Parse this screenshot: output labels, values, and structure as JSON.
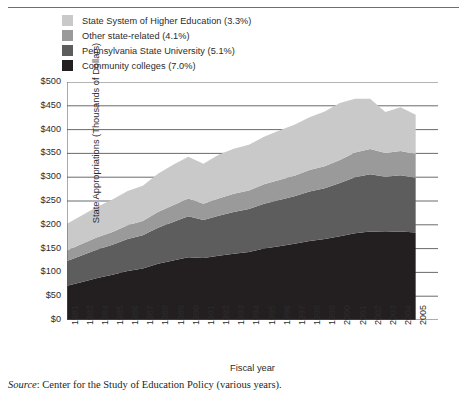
{
  "legend": {
    "items": [
      {
        "label": "State System of Higher Education (3.3%)",
        "color": "#c9c9c9",
        "name": "state-system-higher-education"
      },
      {
        "label": "Other state-related (4.1%)",
        "color": "#9a9a9a",
        "name": "other-state-related"
      },
      {
        "label": "Pennsylvania State University (5.1%)",
        "color": "#5d5d5d",
        "name": "pennsylvania-state-university"
      },
      {
        "label": "Community colleges (7.0%)",
        "color": "#231f20",
        "name": "community-colleges"
      }
    ]
  },
  "source": {
    "prefix": "Source",
    "text": ": Center for the Study of Education Policy (various years)."
  },
  "chart_data": {
    "type": "area",
    "stacked": true,
    "title": "",
    "xlabel": "Fiscal year",
    "ylabel": "State Appropriations (Thousands of Dollars)",
    "ylim": [
      0,
      500
    ],
    "ytick_step": 50,
    "ytick_labels": [
      "$500",
      "$450",
      "$400",
      "$350",
      "$300",
      "$250",
      "$200",
      "$150",
      "$100",
      "$50",
      "$0"
    ],
    "ytick_values": [
      500,
      450,
      400,
      350,
      300,
      250,
      200,
      150,
      100,
      50,
      0
    ],
    "grid": true,
    "legend_position": "above-left",
    "x": [
      1981,
      1982,
      1984,
      1985,
      1986,
      1987,
      1988,
      1989,
      1990,
      1991,
      1992,
      1993,
      1994,
      1995,
      1996,
      1997,
      1998,
      1999,
      2000,
      2001,
      2002,
      2003,
      2004,
      2005
    ],
    "categories": [
      "1981",
      "1982",
      "1984",
      "1985",
      "1986",
      "1987",
      "1988",
      "1989",
      "1990",
      "1991",
      "1992",
      "1993",
      "1994",
      "1995",
      "1996",
      "1997",
      "1998",
      "1999",
      "2000",
      "2001",
      "2002",
      "2003",
      "2004",
      "2005"
    ],
    "series": [
      {
        "name": "Community colleges (7.0%)",
        "color": "#231f20",
        "values": [
          72,
          80,
          88,
          95,
          103,
          108,
          118,
          125,
          132,
          130,
          135,
          139,
          143,
          150,
          155,
          160,
          166,
          170,
          176,
          182,
          186,
          185,
          186,
          184
        ]
      },
      {
        "name": "Pennsylvania State University (5.1%)",
        "color": "#5d5d5d",
        "values": [
          52,
          56,
          60,
          63,
          67,
          70,
          76,
          81,
          86,
          80,
          84,
          88,
          90,
          94,
          97,
          100,
          104,
          107,
          112,
          118,
          120,
          116,
          118,
          115
        ]
      },
      {
        "name": "Other state-related (4.1%)",
        "color": "#9a9a9a",
        "values": [
          22,
          24,
          26,
          27,
          29,
          30,
          33,
          35,
          37,
          34,
          36,
          38,
          39,
          41,
          42,
          43,
          45,
          46,
          48,
          52,
          53,
          50,
          51,
          50
        ]
      },
      {
        "name": "State System of Higher Education (3.3%)",
        "color": "#c9c9c9",
        "values": [
          56,
          60,
          64,
          68,
          72,
          74,
          80,
          85,
          88,
          84,
          92,
          95,
          96,
          100,
          104,
          107,
          111,
          115,
          120,
          113,
          106,
          86,
          92,
          82
        ]
      }
    ],
    "totals": [
      202,
      220,
      238,
      253,
      271,
      282,
      307,
      326,
      343,
      328,
      347,
      360,
      368,
      385,
      398,
      410,
      426,
      438,
      456,
      465,
      465,
      437,
      447,
      431
    ]
  }
}
